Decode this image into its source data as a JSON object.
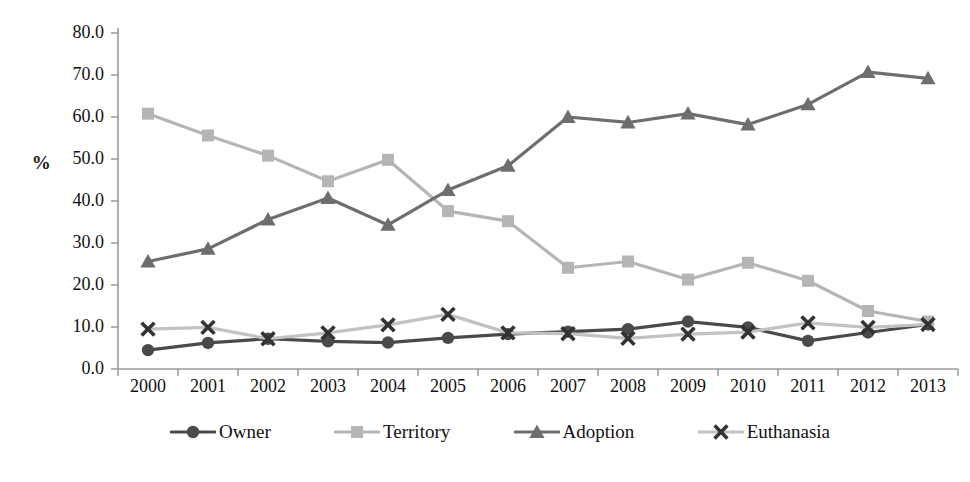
{
  "chart_data": {
    "type": "line",
    "title": "",
    "xlabel": "",
    "ylabel": "%",
    "categories": [
      "2000",
      "2001",
      "2002",
      "2003",
      "2004",
      "2005",
      "2006",
      "2007",
      "2008",
      "2009",
      "2010",
      "2011",
      "2012",
      "2013"
    ],
    "x": [
      2000,
      2001,
      2002,
      2003,
      2004,
      2005,
      2006,
      2007,
      2008,
      2009,
      2010,
      2011,
      2012,
      2013
    ],
    "ylim": [
      0,
      80
    ],
    "ytick_labels": [
      "0.0",
      "10.0",
      "20.0",
      "30.0",
      "40.0",
      "50.0",
      "60.0",
      "70.0",
      "80.0"
    ],
    "ytick_values": [
      0,
      10,
      20,
      30,
      40,
      50,
      60,
      70,
      80
    ],
    "grid": false,
    "legend_position": "bottom",
    "series": [
      {
        "name": "Owner",
        "marker": "circle",
        "color": "#4a4a4a",
        "values": [
          4.5,
          6.2,
          7.2,
          6.6,
          6.3,
          7.4,
          8.3,
          8.9,
          9.5,
          11.3,
          9.9,
          6.7,
          8.7,
          10.6
        ]
      },
      {
        "name": "Territory",
        "marker": "square",
        "color": "#b5b5b5",
        "values": [
          60.8,
          55.6,
          50.8,
          44.7,
          49.8,
          37.6,
          35.2,
          24.1,
          25.6,
          21.3,
          25.3,
          21.0,
          13.8,
          11.3
        ]
      },
      {
        "name": "Adoption",
        "marker": "triangle",
        "color": "#6e6e6e",
        "values": [
          25.6,
          28.6,
          35.6,
          40.7,
          34.3,
          42.6,
          48.4,
          60.0,
          58.7,
          60.8,
          58.2,
          63.0,
          70.7,
          69.2
        ]
      },
      {
        "name": "Euthanasia",
        "marker": "cross",
        "color": "#c2c2c2",
        "marker_color": "#333333",
        "values": [
          9.5,
          9.9,
          7.2,
          8.6,
          10.5,
          13.0,
          8.6,
          8.4,
          7.3,
          8.3,
          8.8,
          11.0,
          9.9,
          10.6
        ]
      }
    ]
  },
  "legend": {
    "items": [
      {
        "label": "Owner"
      },
      {
        "label": "Territory"
      },
      {
        "label": "Adoption"
      },
      {
        "label": "Euthanasia"
      }
    ]
  },
  "axes": {
    "y_title": "%"
  }
}
